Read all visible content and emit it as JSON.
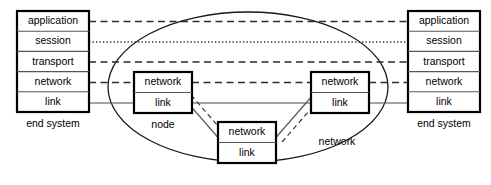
{
  "diagram": {
    "background_color": "#ffffff",
    "line_color": "#000000",
    "width": 491,
    "height": 185
  },
  "left_end_system": {
    "caption": "end system",
    "layers": [
      {
        "label": "application",
        "connector": "dashed"
      },
      {
        "label": "session",
        "connector": "dotted"
      },
      {
        "label": "transport",
        "connector": "dashed"
      },
      {
        "label": "network",
        "connector": "dashed"
      },
      {
        "label": "link",
        "connector": "solid"
      }
    ]
  },
  "right_end_system": {
    "caption": "end system",
    "layers": [
      {
        "label": "application",
        "connector": "dashed"
      },
      {
        "label": "session",
        "connector": "dotted"
      },
      {
        "label": "transport",
        "connector": "dashed"
      },
      {
        "label": "network",
        "connector": "dashed"
      },
      {
        "label": "link",
        "connector": "solid"
      }
    ]
  },
  "network_cloud": {
    "label": "network",
    "shape": "ellipse"
  },
  "nodes": [
    {
      "id": "node-left",
      "caption": "node",
      "layers": [
        {
          "label": "network"
        },
        {
          "label": "link"
        }
      ]
    },
    {
      "id": "node-bottom",
      "caption": "",
      "layers": [
        {
          "label": "network"
        },
        {
          "label": "link"
        }
      ]
    },
    {
      "id": "node-right",
      "caption": "",
      "layers": [
        {
          "label": "network"
        },
        {
          "label": "link"
        }
      ]
    }
  ],
  "labels": {
    "application": "application",
    "session": "session",
    "transport": "transport",
    "network": "network",
    "link": "link",
    "end_system": "end system",
    "node": "node",
    "network_cloud": "network"
  }
}
